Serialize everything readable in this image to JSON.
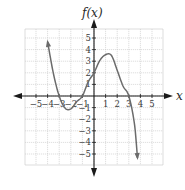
{
  "chart_data": {
    "type": "line",
    "title": "",
    "xlabel": "x",
    "ylabel": "f(x)",
    "xlim": [
      -6,
      6
    ],
    "ylim": [
      -6,
      6
    ],
    "grid": true,
    "x_ticks": [
      -5,
      -4,
      -3,
      -2,
      -1,
      1,
      2,
      3,
      4,
      5
    ],
    "y_ticks": [
      -5,
      -4,
      -3,
      -2,
      -1,
      1,
      2,
      3,
      4,
      5
    ],
    "x_tick_labels": [
      "−5",
      "−4",
      "−3",
      "−2",
      "−1",
      "1",
      "2",
      "3",
      "4",
      "5"
    ],
    "y_tick_labels": [
      "−5",
      "−4",
      "−3",
      "−2",
      "−1",
      "1",
      "2",
      "3",
      "4",
      "5"
    ],
    "series": [
      {
        "name": "f(x)",
        "x_range": [
          -4,
          3.75
        ],
        "points": [
          [
            -4,
            4.67
          ],
          [
            -3.5,
            1.94
          ],
          [
            -3,
            0
          ],
          [
            -2.5,
            -1.04
          ],
          [
            -2,
            -1.11
          ],
          [
            -1.5,
            -0.5
          ],
          [
            -1,
            0
          ],
          [
            -0.5,
            1.22
          ],
          [
            0,
            2
          ],
          [
            0.5,
            3.06
          ],
          [
            1,
            3.56
          ],
          [
            1.5,
            3.5
          ],
          [
            2,
            2.22
          ],
          [
            2.5,
            0.86
          ],
          [
            3,
            0
          ],
          [
            3.5,
            -2.5
          ],
          [
            3.75,
            -5.34
          ]
        ],
        "zeros": [
          -3,
          -1,
          3
        ],
        "y_intercept": 2,
        "local_min": [
          -2,
          -1.1
        ],
        "local_max": [
          1.1,
          3.6
        ],
        "end_behavior": "arrows at both ends (rises left, falls right)"
      }
    ]
  },
  "axes": {
    "x_label": "x",
    "y_label": "f(x)"
  },
  "style": {
    "curve_color": "#6b6b6b",
    "axis_color": "#1a1a1a",
    "grid_color": "#c8c8c8"
  }
}
